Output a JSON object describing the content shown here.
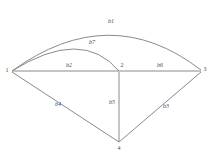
{
  "diagram": {
    "type": "graph",
    "background_color": "#ffffff",
    "stroke_color": "#8a8a8a",
    "label_color": "#4a4a4a",
    "nodes": [
      {
        "id": "1",
        "label": "1",
        "x": 10,
        "y": 72
      },
      {
        "id": "2",
        "label": "2",
        "x": 119,
        "y": 72
      },
      {
        "id": "3",
        "label": "3",
        "x": 202,
        "y": 72
      },
      {
        "id": "4",
        "label": "4",
        "x": 119,
        "y": 143
      }
    ],
    "edges": [
      {
        "id": "b1",
        "label": "b1",
        "from": "1",
        "to": "3",
        "shape": "arc",
        "label_x": 111,
        "label_y": 22
      },
      {
        "id": "b7",
        "label": "b7",
        "from": "1",
        "to": "2",
        "shape": "arc",
        "label_x": 92,
        "label_y": 43
      },
      {
        "id": "b2",
        "label": "b2",
        "from": "1",
        "to": "2",
        "shape": "line",
        "label_x": 69,
        "label_y": 66
      },
      {
        "id": "b6",
        "label": "b6",
        "from": "2",
        "to": "3",
        "shape": "line",
        "label_x": 160,
        "label_y": 66
      },
      {
        "id": "b4",
        "label": "b4",
        "from": "1",
        "to": "4",
        "shape": "line",
        "label_x": 58,
        "label_y": 105
      },
      {
        "id": "b5",
        "label": "b5",
        "from": "2",
        "to": "4",
        "shape": "line",
        "label_x": 112,
        "label_y": 103
      },
      {
        "id": "b3",
        "label": "b3",
        "from": "4",
        "to": "3",
        "shape": "line",
        "label_x": 166,
        "label_y": 107
      }
    ]
  }
}
